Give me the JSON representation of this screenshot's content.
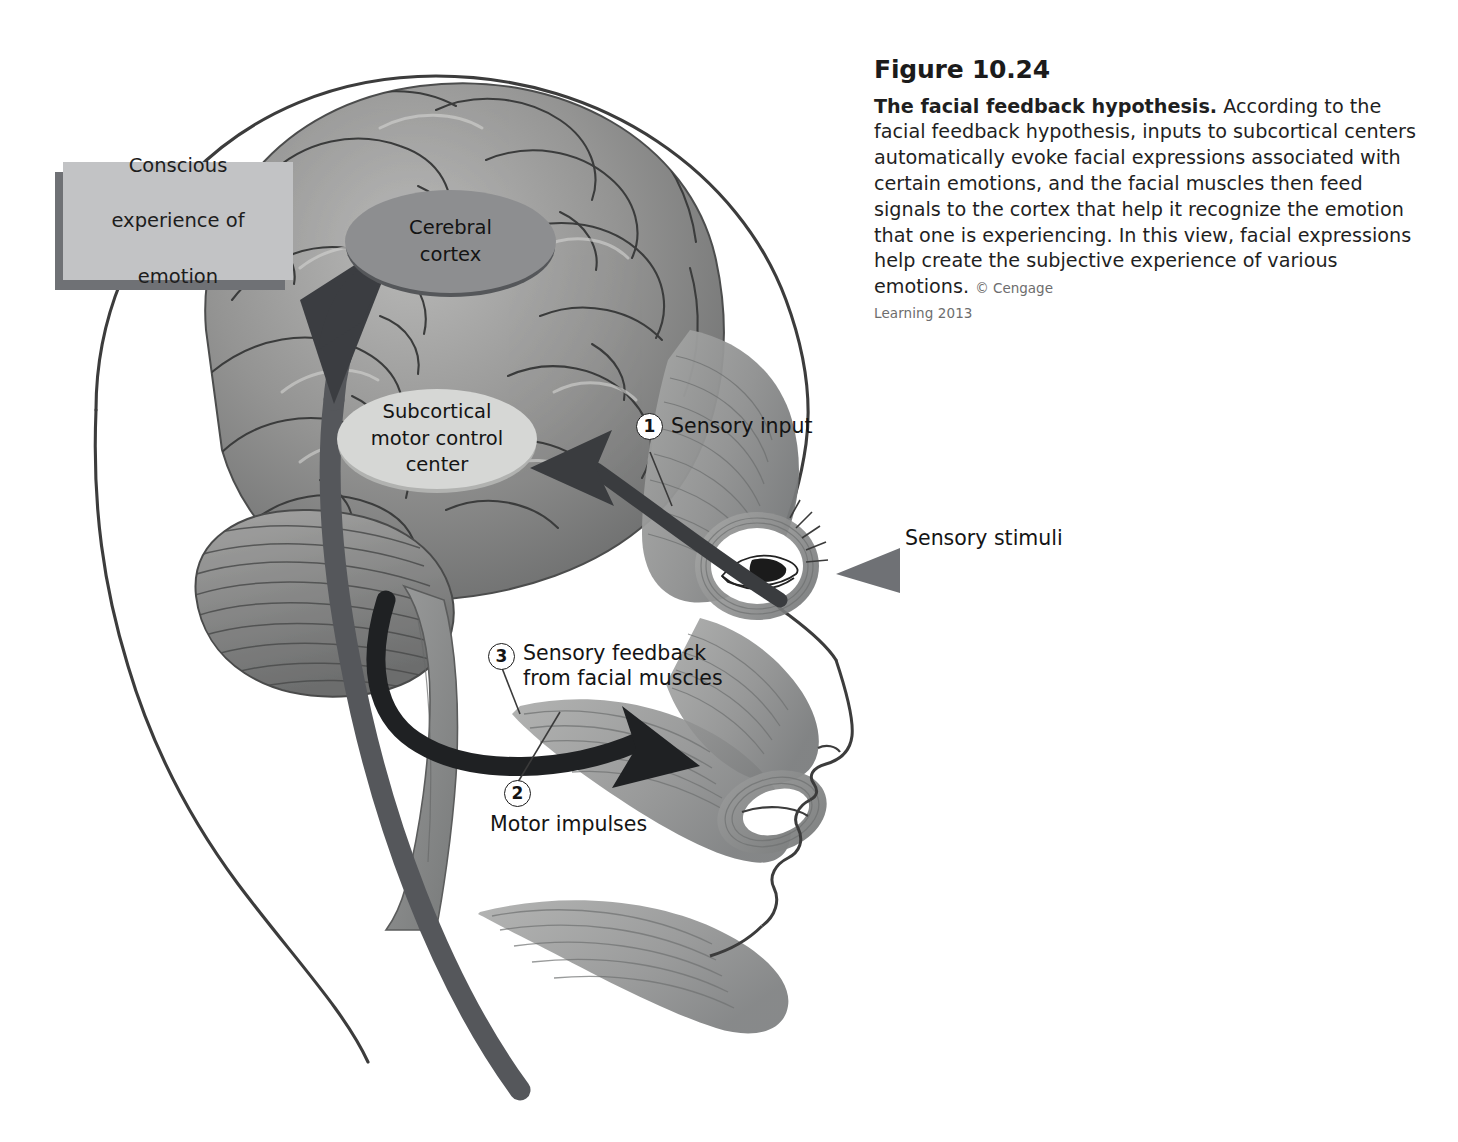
{
  "figure": {
    "number_label": "Figure 10.24",
    "title": "The facial feedback hypothesis.",
    "body": " According to the facial feedback hypothesis, inputs to subcortical centers automatically evoke facial expressions associated with certain emotions, and the facial muscles then feed signals to the cortex that help it recognize the emotion that one is experiencing. In this view, facial expressions help create the subjective experience of various emotions. ",
    "credit": "© Cengage",
    "credit_line2": "Learning 2013"
  },
  "diagram": {
    "type": "anatomical-flow-diagram",
    "boxes": [
      {
        "id": "conscious-experience",
        "label": "Conscious\nexperience of\nemotion",
        "line1": "Conscious",
        "line2": "experience of",
        "line3": "emotion",
        "shape": "rectangle",
        "fill": "#c2c3c5",
        "shadow": "#6f7175"
      }
    ],
    "ellipses": [
      {
        "id": "cerebral-cortex",
        "line1": "Cerebral",
        "line2": "cortex",
        "fill": "#8d8e90",
        "edge": "#55575a"
      },
      {
        "id": "subcortical-motor-control-center",
        "line1": "Subcortical",
        "line2": "motor control",
        "line3": "center",
        "fill": "#d6d7d5",
        "edge": "#b1b2b0"
      }
    ],
    "callouts": [
      {
        "number": "1",
        "text": "Sensory input"
      },
      {
        "number": "3",
        "line1": "Sensory feedback",
        "line2": "from facial muscles"
      },
      {
        "number": "2",
        "text": "Motor impulses"
      }
    ],
    "annotations": [
      {
        "id": "sensory-stimuli",
        "text": "Sensory stimuli",
        "arrow": "left-pointing-tapered-arrow",
        "color": "#6f7175"
      }
    ],
    "arrows": [
      {
        "id": "sensory-input-arrow",
        "from": "face",
        "to": "subcortical-motor-control-center",
        "direction": "left",
        "color": "#3a3c3f"
      },
      {
        "id": "motor-impulses-arrow",
        "from": "subcortical-motor-control-center",
        "to": "facial-muscles",
        "direction": "right",
        "color": "#1e2022"
      },
      {
        "id": "sensory-feedback-arrow",
        "from": "facial-muscles",
        "to": "cerebral-cortex",
        "direction": "up-right",
        "color": "#4a4c50"
      }
    ],
    "colors": {
      "background": "#ffffff",
      "brain": "#8e8f8f",
      "muscle": "#8d8e8e",
      "outline": "#3a3a3a",
      "arrow_dark": "#3a3c3f",
      "arrow_mid": "#6f7175"
    }
  }
}
